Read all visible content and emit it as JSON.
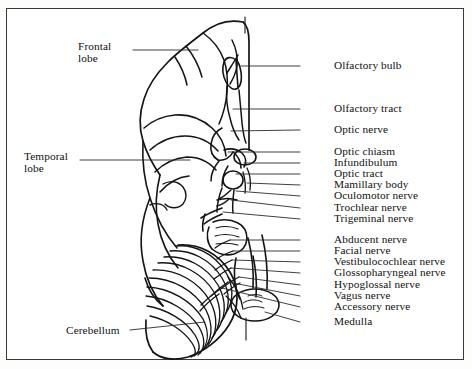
{
  "figure": {
    "type": "anatomical-line-diagram",
    "frame": {
      "stroke": "#3a3a3a",
      "fill": "#ffffff"
    },
    "ink_color": "#141414",
    "midline_axis_x": 245
  },
  "labels_left": [
    {
      "key": "frontal_lobe",
      "lines": [
        "Frontal",
        "lobe"
      ],
      "text": "Frontal lobe",
      "x": 78,
      "y": 40,
      "leader": {
        "x1": 133,
        "y1": 50,
        "x2": 198,
        "y2": 50
      }
    },
    {
      "key": "temporal_lobe",
      "lines": [
        "Temporal",
        "lobe"
      ],
      "text": "Temporal lobe",
      "x": 24,
      "y": 150,
      "leader": {
        "x1": 80,
        "y1": 160,
        "x2": 190,
        "y2": 160
      }
    },
    {
      "key": "cerebellum",
      "lines": [
        "Cerebellum"
      ],
      "text": "Cerebellum",
      "x": 66,
      "y": 325,
      "leader": {
        "x1": 130,
        "y1": 330,
        "x2": 205,
        "y2": 322
      }
    }
  ],
  "labels_right": [
    {
      "key": "olfactory_bulb",
      "text": "Olfactory bulb",
      "x": 334,
      "y": 62,
      "leader": {
        "x1": 300,
        "y1": 66,
        "x2": 241,
        "y2": 66
      }
    },
    {
      "key": "olfactory_tract",
      "text": "Olfactory tract",
      "x": 334,
      "y": 105,
      "leader": {
        "x1": 300,
        "y1": 109,
        "x2": 233,
        "y2": 109
      }
    },
    {
      "key": "optic_nerve",
      "text": "Optic nerve",
      "x": 334,
      "y": 126,
      "leader": {
        "x1": 300,
        "y1": 130,
        "x2": 231,
        "y2": 131
      }
    },
    {
      "key": "optic_chiasm",
      "text": "Optic chiasm",
      "x": 334,
      "y": 148,
      "leader": {
        "x1": 300,
        "y1": 152,
        "x2": 228,
        "y2": 152
      }
    },
    {
      "key": "infundibulum",
      "text": "Infundibulum",
      "x": 334,
      "y": 159,
      "leader": {
        "x1": 300,
        "y1": 163,
        "x2": 244,
        "y2": 163
      }
    },
    {
      "key": "optic_tract",
      "text": "Optic tract",
      "x": 334,
      "y": 170,
      "leader": {
        "x1": 300,
        "y1": 174,
        "x2": 236,
        "y2": 174
      }
    },
    {
      "key": "mamillary_body",
      "text": "Mamillary body",
      "x": 334,
      "y": 181,
      "leader": {
        "x1": 300,
        "y1": 185,
        "x2": 247,
        "y2": 183
      }
    },
    {
      "key": "oculomotor_nerve",
      "text": "Oculomotor nerve",
      "x": 334,
      "y": 192,
      "leader": {
        "x1": 300,
        "y1": 196,
        "x2": 236,
        "y2": 191
      }
    },
    {
      "key": "trochlear_nerve",
      "text": "Trochlear nerve",
      "x": 334,
      "y": 204,
      "leader": {
        "x1": 300,
        "y1": 208,
        "x2": 231,
        "y2": 200
      }
    },
    {
      "key": "trigeminal_nerve",
      "text": "Trigeminal nerve",
      "x": 334,
      "y": 215,
      "leader": {
        "x1": 300,
        "y1": 219,
        "x2": 223,
        "y2": 212
      }
    },
    {
      "key": "abducent_nerve",
      "text": "Abducent nerve",
      "x": 334,
      "y": 236,
      "leader": {
        "x1": 300,
        "y1": 240,
        "x2": 230,
        "y2": 240
      }
    },
    {
      "key": "facial_nerve",
      "text": "Facial nerve",
      "x": 334,
      "y": 247,
      "leader": {
        "x1": 300,
        "y1": 251,
        "x2": 233,
        "y2": 251
      }
    },
    {
      "key": "vestibulocochlear_nerve",
      "text": "Vestibulocochlear nerve",
      "x": 334,
      "y": 258,
      "leader": {
        "x1": 300,
        "y1": 262,
        "x2": 232,
        "y2": 260
      }
    },
    {
      "key": "glossopharyngeal_nerve",
      "text": "Glossopharyngeal nerve",
      "x": 334,
      "y": 269,
      "leader": {
        "x1": 300,
        "y1": 273,
        "x2": 231,
        "y2": 268
      }
    },
    {
      "key": "hypoglossal_nerve",
      "text": "Hypoglossal nerve",
      "x": 334,
      "y": 281,
      "leader": {
        "x1": 300,
        "y1": 285,
        "x2": 239,
        "y2": 277
      }
    },
    {
      "key": "vagus_nerve",
      "text": "Vagus nerve",
      "x": 334,
      "y": 292,
      "leader": {
        "x1": 300,
        "y1": 296,
        "x2": 228,
        "y2": 282
      }
    },
    {
      "key": "accessory_nerve",
      "text": "Accessory nerve",
      "x": 334,
      "y": 303,
      "leader": {
        "x1": 300,
        "y1": 307,
        "x2": 222,
        "y2": 288
      }
    },
    {
      "key": "medulla",
      "text": "Medulla",
      "x": 334,
      "y": 318,
      "leader": {
        "x1": 300,
        "y1": 322,
        "x2": 265,
        "y2": 312
      }
    }
  ]
}
